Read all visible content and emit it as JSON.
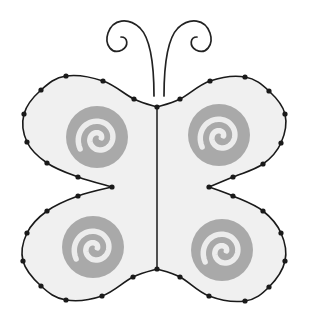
{
  "figure": {
    "width": 309,
    "height": 326
  },
  "colors": {
    "background": "#ffffff",
    "wing_fill": "#f0f0f0",
    "outline": "#1a1a1a",
    "dot": "#1a1a1a",
    "spiral_disk": "#a9a9a9",
    "spiral_line": "#ececec"
  },
  "body": {
    "top": [
      157,
      107
    ],
    "bottom": [
      157,
      269
    ]
  },
  "wings": {
    "upper_left": {
      "dots": [
        [
          157,
          107
        ],
        [
          134,
          99
        ],
        [
          103,
          81
        ],
        [
          66,
          76
        ],
        [
          41,
          90
        ],
        [
          24,
          114
        ],
        [
          27,
          142
        ],
        [
          47,
          163
        ],
        [
          78,
          177
        ],
        [
          112,
          187
        ]
      ]
    },
    "upper_right": {
      "dots": [
        [
          157,
          107
        ],
        [
          180,
          99
        ],
        [
          210,
          81
        ],
        [
          245,
          77
        ],
        [
          269,
          91
        ],
        [
          285,
          114
        ],
        [
          281,
          143
        ],
        [
          263,
          164
        ],
        [
          233,
          177
        ],
        [
          209,
          187
        ]
      ]
    },
    "lower_left": {
      "dots": [
        [
          112,
          187
        ],
        [
          78,
          196
        ],
        [
          47,
          211
        ],
        [
          27,
          233
        ],
        [
          23,
          261
        ],
        [
          41,
          286
        ],
        [
          66,
          300
        ],
        [
          102,
          296
        ],
        [
          133,
          277
        ],
        [
          157,
          269
        ]
      ]
    },
    "lower_right": {
      "dots": [
        [
          209,
          187
        ],
        [
          233,
          196
        ],
        [
          263,
          211
        ],
        [
          281,
          233
        ],
        [
          285,
          261
        ],
        [
          269,
          287
        ],
        [
          245,
          301
        ],
        [
          209,
          296
        ],
        [
          180,
          277
        ],
        [
          157,
          269
        ]
      ]
    }
  },
  "spirals": [
    {
      "name": "upper-left",
      "cx": 97,
      "cy": 137,
      "r": 31
    },
    {
      "name": "upper-right",
      "cx": 219,
      "cy": 135,
      "r": 31
    },
    {
      "name": "lower-left",
      "cx": 93,
      "cy": 247,
      "r": 31
    },
    {
      "name": "lower-right",
      "cx": 222,
      "cy": 250,
      "r": 31
    }
  ],
  "antennae": {
    "left": {
      "base": [
        154,
        96
      ]
    },
    "right": {
      "base": [
        164,
        96
      ]
    }
  }
}
